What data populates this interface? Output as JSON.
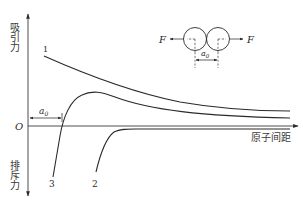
{
  "figure": {
    "y_axis_positive_label": "吸引力",
    "y_axis_negative_label": "排斥力",
    "x_axis_label": "原子间距",
    "origin_label": "O",
    "equilibrium_label": "a",
    "equilibrium_subscript": "0",
    "curves": [
      {
        "id": "1",
        "label": "1"
      },
      {
        "id": "2",
        "label": "2"
      },
      {
        "id": "3",
        "label": "3"
      }
    ],
    "inset": {
      "force_left_label": "F",
      "force_right_label": "F",
      "spacing_label": "a",
      "spacing_subscript": "0"
    }
  },
  "colors": {
    "line": "#2a2a2a",
    "background": "#ffffff"
  }
}
